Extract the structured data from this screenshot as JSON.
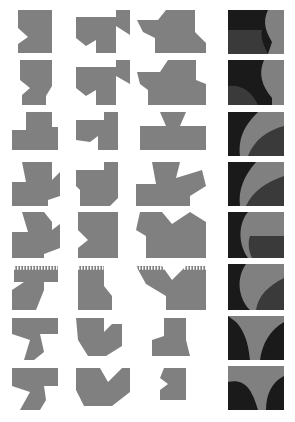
{
  "figure": {
    "width": 295,
    "height": 422,
    "background_color": "#ffffff",
    "colors": {
      "shape_gray": "#808080",
      "shape_dark": "#1a1a1a",
      "shape_mid_dark": "#3a3a3a",
      "background": "#ffffff"
    },
    "grid": {
      "rows": 8,
      "columns": 4,
      "column_labels": [
        "column-1",
        "column-2",
        "column-3",
        "column-4"
      ],
      "row_labels": [
        "row-1",
        "row-2",
        "row-3",
        "row-4",
        "row-5",
        "row-6",
        "row-7",
        "row-8"
      ],
      "column_x_origins": [
        18,
        76,
        137,
        228
      ],
      "row_y_origins": [
        10,
        60,
        112,
        162,
        212,
        262,
        315,
        365
      ],
      "cell_width": 56,
      "cell_height": 44
    },
    "cells": [
      {
        "id": "r1c1",
        "row": 1,
        "column": 1,
        "fill": "#808080",
        "kind": "silhouette",
        "points": "18,10 52,10 52,53 18,53 18,44 28,37 18,28"
      },
      {
        "id": "r1c2",
        "row": 1,
        "column": 2,
        "fill": "#808080",
        "kind": "silhouette",
        "points": "76,17 116,17 116,10 130,10 130,35 116,26 116,53 96,53 96,40 86,46 76,38"
      },
      {
        "id": "r1c3",
        "row": 1,
        "column": 3,
        "fill": "#808080",
        "kind": "silhouette",
        "points": "137,20 158,20 166,10 195,10 195,32 206,43 206,53 155,53 155,38 143,32"
      },
      {
        "id": "r1c4",
        "row": 1,
        "column": 4,
        "fill": "#808080",
        "kind": "panel",
        "rect": [
          228,
          10,
          56,
          44
        ],
        "regions": [
          {
            "color": "#1a1a1a",
            "path": "M228,10 L268,10 C262,22 266,32 272,42 L268,54 L228,54 Z"
          },
          {
            "color": "#3a3a3a",
            "path": "M228,30 L262,30 C260,38 264,46 268,54 L228,54 Z"
          }
        ]
      },
      {
        "id": "r2c1",
        "row": 2,
        "column": 1,
        "fill": "#808080",
        "kind": "silhouette",
        "points": "20,60 52,60 52,86 46,96 46,105 22,105 22,95 30,88 20,80"
      },
      {
        "id": "r2c2",
        "row": 2,
        "column": 2,
        "fill": "#808080",
        "kind": "silhouette",
        "points": "76,67 116,67 116,60 130,60 130,84 116,76 116,105 96,105 96,90 86,96 76,88"
      },
      {
        "id": "r2c3",
        "row": 2,
        "column": 3,
        "fill": "#808080",
        "kind": "silhouette",
        "points": "137,72 160,72 168,60 196,60 196,80 206,84 206,105 148,105 148,90 140,84"
      },
      {
        "id": "r2c4",
        "row": 2,
        "column": 4,
        "fill": "#808080",
        "kind": "panel",
        "rect": [
          228,
          60,
          56,
          45
        ],
        "regions": [
          {
            "color": "#1a1a1a",
            "path": "M228,60 L264,60 C258,74 262,86 272,98 L272,105 L228,105 Z"
          },
          {
            "color": "#3a3a3a",
            "path": "M228,86 C242,84 252,92 258,105 L228,105 Z"
          }
        ]
      },
      {
        "id": "r3c1",
        "row": 3,
        "column": 1,
        "fill": "#808080",
        "kind": "silhouette",
        "points": "26,112 52,112 52,127 58,127 58,150 12,150 12,130 26,130"
      },
      {
        "id": "r3c2",
        "row": 3,
        "column": 2,
        "fill": "#808080",
        "kind": "silhouette",
        "points": "76,120 104,120 104,112 118,112 118,150 98,150 98,136 90,142 76,140"
      },
      {
        "id": "r3c3",
        "row": 3,
        "column": 3,
        "fill": "#808080",
        "kind": "silhouette",
        "points": "160,112 186,112 180,126 206,126 206,150 140,150 140,126 166,126"
      },
      {
        "id": "r3c4",
        "row": 3,
        "column": 4,
        "fill": "#808080",
        "kind": "panel",
        "rect": [
          228,
          112,
          56,
          44
        ],
        "regions": [
          {
            "color": "#1a1a1a",
            "path": "M228,112 L258,112 C246,124 238,136 240,156 L228,156 Z"
          },
          {
            "color": "#3a3a3a",
            "path": "M284,126 C268,130 254,140 248,156 L284,156 Z"
          }
        ]
      },
      {
        "id": "r4c1",
        "row": 4,
        "column": 1,
        "fill": "#808080",
        "kind": "silhouette",
        "points": "22,162 52,162 52,180 60,172 60,196 48,200 48,206 12,206 12,182 26,182"
      },
      {
        "id": "r4c2",
        "row": 4,
        "column": 2,
        "fill": "#808080",
        "kind": "silhouette",
        "points": "76,170 104,170 104,162 118,162 118,198 110,206 80,206 80,190 76,186"
      },
      {
        "id": "r4c3",
        "row": 4,
        "column": 3,
        "fill": "#808080",
        "kind": "silhouette",
        "points": "152,162 180,162 176,178 202,170 206,186 190,196 190,206 136,206 136,184 156,184"
      },
      {
        "id": "r4c4",
        "row": 4,
        "column": 4,
        "fill": "#808080",
        "kind": "panel",
        "rect": [
          228,
          162,
          56,
          44
        ],
        "regions": [
          {
            "color": "#1a1a1a",
            "path": "M228,162 L256,162 C244,176 238,190 240,206 L228,206 Z"
          },
          {
            "color": "#3a3a3a",
            "path": "M284,176 C266,182 252,192 246,206 L284,206 Z"
          }
        ]
      },
      {
        "id": "r5c1",
        "row": 5,
        "column": 1,
        "fill": "#808080",
        "kind": "silhouette",
        "points": "22,212 44,212 52,222 52,230 60,224 60,248 44,254 44,258 12,258 12,232 28,232"
      },
      {
        "id": "r5c2",
        "row": 5,
        "column": 2,
        "fill": "#808080",
        "kind": "silhouette",
        "points": "78,212 118,212 118,258 78,258 78,248 88,240 78,230"
      },
      {
        "id": "r5c3",
        "row": 5,
        "column": 3,
        "fill": "#808080",
        "kind": "silhouette",
        "points": "140,212 162,212 172,224 190,212 206,222 206,258 146,258 146,236 136,230"
      },
      {
        "id": "r5c4",
        "row": 5,
        "column": 4,
        "fill": "#808080",
        "kind": "panel",
        "rect": [
          228,
          212,
          56,
          46
        ],
        "regions": [
          {
            "color": "#1a1a1a",
            "path": "M228,212 L248,212 C238,224 238,244 248,258 L228,258 Z"
          },
          {
            "color": "#3a3a3a",
            "path": "M250,236 L284,236 L284,258 L252,258 C248,250 248,242 250,236 Z"
          }
        ]
      },
      {
        "id": "r6c1",
        "row": 6,
        "column": 1,
        "fill": "#808080",
        "kind": "silhouette",
        "dashed_top": true,
        "points": "14,266 58,266 58,282 44,282 44,290 36,310 12,310 12,290 24,282 14,282"
      },
      {
        "id": "r6c2",
        "row": 6,
        "column": 2,
        "fill": "#808080",
        "kind": "silhouette",
        "dashed_top": true,
        "points": "78,266 104,266 104,286 112,296 112,310 78,310"
      },
      {
        "id": "r6c3",
        "row": 6,
        "column": 3,
        "fill": "#808080",
        "kind": "silhouette",
        "dashed_top": true,
        "points": "136,266 162,266 172,280 186,266 206,266 206,310 166,310 166,296 146,284"
      },
      {
        "id": "r6c4",
        "row": 6,
        "column": 4,
        "fill": "#808080",
        "kind": "panel",
        "rect": [
          228,
          264,
          56,
          46
        ],
        "regions": [
          {
            "color": "#1a1a1a",
            "path": "M228,264 L246,264 C236,278 238,298 250,310 L228,310 Z"
          },
          {
            "color": "#3a3a3a",
            "path": "M284,278 C268,286 258,296 256,310 L284,310 Z"
          }
        ]
      },
      {
        "id": "r7c1",
        "row": 7,
        "column": 1,
        "fill": "#808080",
        "kind": "silhouette",
        "points": "12,318 58,318 58,334 40,334 44,352 34,360 24,360 30,340 12,334"
      },
      {
        "id": "r7c2",
        "row": 7,
        "column": 2,
        "fill": "#808080",
        "kind": "silhouette",
        "points": "76,318 104,318 104,332 112,324 122,324 122,346 106,356 88,356 78,340"
      },
      {
        "id": "r7c3",
        "row": 7,
        "column": 3,
        "fill": "#808080",
        "kind": "silhouette",
        "points": "164,318 186,318 186,340 190,356 152,356 152,340 164,336"
      },
      {
        "id": "r7c4",
        "row": 7,
        "column": 4,
        "fill": "#808080",
        "kind": "panel",
        "rect": [
          228,
          316,
          56,
          44
        ],
        "regions": [
          {
            "color": "#1a1a1a",
            "path": "M228,316 L228,360 L252,360 C248,344 244,330 236,322 Z"
          },
          {
            "color": "#1a1a1a",
            "path": "M284,322 C270,330 262,344 260,360 L284,360 Z"
          },
          {
            "color": "#808080",
            "path": "M236,316 L284,316 L284,320 C268,328 258,342 256,360 L250,360 C248,342 244,326 236,318 Z"
          }
        ]
      },
      {
        "id": "r8c1",
        "row": 8,
        "column": 1,
        "fill": "#808080",
        "kind": "silhouette",
        "points": "12,368 58,368 58,386 44,386 46,400 40,410 20,410 30,392 12,386"
      },
      {
        "id": "r8c2",
        "row": 8,
        "column": 2,
        "fill": "#808080",
        "kind": "silhouette",
        "points": "76,368 100,368 108,382 122,368 130,368 130,392 112,406 84,406 76,390"
      },
      {
        "id": "r8c3",
        "row": 8,
        "column": 3,
        "fill": "#808080",
        "kind": "silhouette",
        "points": "164,368 186,368 186,400 160,400 160,390 168,384 160,378"
      },
      {
        "id": "r8c4",
        "row": 8,
        "column": 4,
        "fill": "#808080",
        "kind": "panel",
        "rect": [
          228,
          366,
          56,
          44
        ],
        "regions": [
          {
            "color": "#1a1a1a",
            "path": "M228,382 C242,378 254,388 260,410 L228,410 Z"
          },
          {
            "color": "#1a1a1a",
            "path": "M284,376 C272,382 266,394 266,410 L284,410 Z"
          },
          {
            "color": "#808080",
            "path": "M228,366 L284,366 L284,374 C270,380 262,394 262,410 L258,410 C252,388 242,376 228,380 Z"
          }
        ]
      }
    ]
  }
}
